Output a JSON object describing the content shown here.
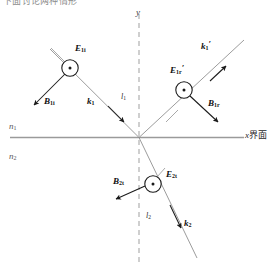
{
  "figure": {
    "top_caption": "下面讨论两种情形",
    "axes": {
      "y_label": "y",
      "x_label": "x",
      "interface_label": "界面"
    },
    "media": {
      "upper": {
        "symbol": "n",
        "subscript": "1"
      },
      "lower": {
        "symbol": "n",
        "subscript": "2"
      }
    },
    "incident": {
      "E": {
        "symbol": "E",
        "subscript": "1i",
        "prime": ""
      },
      "B": {
        "symbol": "B",
        "subscript": "1i",
        "prime": ""
      },
      "k": {
        "symbol": "k",
        "subscript": "1",
        "prime": ""
      },
      "ray": {
        "symbol": "l",
        "subscript": "1"
      }
    },
    "reflected": {
      "E": {
        "symbol": "E",
        "subscript": "1r",
        "prime": "′"
      },
      "B": {
        "symbol": "B",
        "subscript": "1r",
        "prime": ""
      },
      "k": {
        "symbol": "k",
        "subscript": "1",
        "prime": "′"
      }
    },
    "transmitted": {
      "E": {
        "symbol": "E",
        "subscript": "2t",
        "prime": ""
      },
      "B": {
        "symbol": "B",
        "subscript": "2t",
        "prime": ""
      },
      "k": {
        "symbol": "k",
        "subscript": "2",
        "prime": ""
      },
      "ray": {
        "symbol": "l",
        "subscript": "2"
      }
    },
    "field_markers": {
      "out_of_page_glyph": "⊙",
      "count": 3,
      "meaning": "E field out of page"
    },
    "colors": {
      "interface_line": "#9a9a9a",
      "dashed_axis": "#a8a8a8",
      "ray_line": "#8a8a8a",
      "arrow": "#1a1a1a",
      "text": "#111111",
      "caption": "#8d8d8d",
      "background": "#ffffff"
    }
  }
}
